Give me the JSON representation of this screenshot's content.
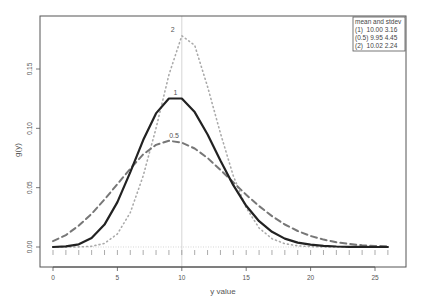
{
  "chart_data": {
    "type": "line",
    "title": "",
    "xlabel": "y value",
    "ylabel": "g(y)",
    "xlim": [
      -1,
      27
    ],
    "ylim": [
      -0.018,
      0.19
    ],
    "x_ticks": [
      0,
      5,
      10,
      15,
      20,
      25
    ],
    "x_tick_labels": [
      "0",
      "5",
      "10",
      "15",
      "20",
      "25"
    ],
    "y_ticks": [
      0.0,
      0.05,
      0.1,
      0.15
    ],
    "y_tick_labels": [
      "0.00",
      "0.05",
      "0.10",
      "0.15"
    ],
    "grid": false,
    "reference_vline_x": 10,
    "reference_hline_y": 0,
    "rug_ticks_x": [
      0,
      1,
      2,
      3,
      4,
      5,
      6,
      7,
      8,
      9,
      10,
      11,
      12,
      13,
      14,
      15,
      16,
      17,
      18,
      19,
      20,
      21,
      22,
      23,
      24,
      25,
      26
    ],
    "x": [
      0,
      1,
      2,
      3,
      4,
      5,
      6,
      7,
      8,
      9,
      10,
      11,
      12,
      13,
      14,
      15,
      16,
      17,
      18,
      19,
      20,
      21,
      22,
      23,
      24,
      25,
      26
    ],
    "series": [
      {
        "name": "1",
        "style": "solid",
        "color": "#222222",
        "label_at": [
          9.5,
          0.128
        ],
        "values": [
          0.0,
          0.0005,
          0.0023,
          0.0076,
          0.0189,
          0.0378,
          0.0631,
          0.0901,
          0.1126,
          0.1251,
          0.1251,
          0.1137,
          0.0948,
          0.0729,
          0.0521,
          0.0347,
          0.0217,
          0.0128,
          0.0071,
          0.0037,
          0.0019,
          0.0009,
          0.0004,
          0.0002,
          0.0001,
          0.0,
          0.0
        ]
      },
      {
        "name": "0.5",
        "style": "dashed",
        "color": "#777777",
        "label_at": [
          9.4,
          0.092
        ],
        "values": [
          0.005,
          0.01,
          0.018,
          0.028,
          0.04,
          0.053,
          0.066,
          0.078,
          0.086,
          0.0895,
          0.088,
          0.083,
          0.075,
          0.065,
          0.0545,
          0.044,
          0.0345,
          0.026,
          0.019,
          0.0135,
          0.0093,
          0.0062,
          0.004,
          0.0025,
          0.0015,
          0.0009,
          0.0005
        ]
      },
      {
        "name": "2",
        "style": "dotted",
        "color": "#aaaaaa",
        "label_at": [
          9.3,
          0.181
        ],
        "values": [
          0.0,
          0.0,
          0.0001,
          0.0006,
          0.003,
          0.011,
          0.029,
          0.06,
          0.1,
          0.145,
          0.178,
          0.17,
          0.135,
          0.096,
          0.06,
          0.033,
          0.016,
          0.007,
          0.0028,
          0.001,
          0.0003,
          0.0001,
          0.0,
          0.0,
          0.0,
          0.0,
          0.0
        ]
      }
    ],
    "legend": {
      "position": "top-right",
      "title": "mean and stdev",
      "entries": [
        "(1)  10.00 3.16",
        "(0.5) 9.95 4.45",
        "(2)  10.02 2.24"
      ]
    }
  }
}
